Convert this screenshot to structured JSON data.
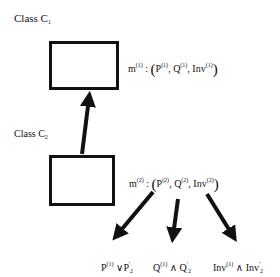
{
  "classes": [
    {
      "label": "Class C",
      "sub": "1",
      "method": {
        "name": "m",
        "index": "(1)",
        "tuple": [
          "P",
          "Q",
          "Inv"
        ]
      }
    },
    {
      "label": "Class C",
      "sub": "2",
      "method": {
        "name": "m",
        "index": "(2)",
        "tuple": [
          "P",
          "Q",
          "Inv"
        ]
      }
    }
  ],
  "results": [
    {
      "left": "P",
      "left_sup": "(1)",
      "op": "∨",
      "right": "P",
      "right_sup": "'",
      "right_sub": "2"
    },
    {
      "left": "Q",
      "left_sup": "(1)",
      "op": "∧",
      "right": "Q",
      "right_sup": "'",
      "right_sub": "2"
    },
    {
      "left": "Inv",
      "left_sup": "(1)",
      "op": "∧",
      "right": "Inv",
      "right_sup": "'",
      "right_sub": "2"
    }
  ],
  "colors": {
    "stroke": "#111111",
    "background": "#ffffff"
  }
}
